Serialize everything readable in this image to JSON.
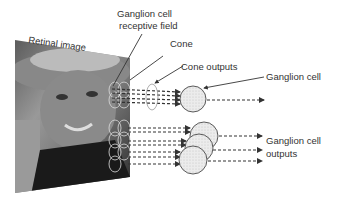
{
  "labels": {
    "retinal_image": "Retinal image",
    "rf_line1": "Ganglion cell",
    "rf_line2": "receptive field",
    "cone": "Cone",
    "cone_outputs": "Cone outputs",
    "ganglion_cell": "Ganglion cell",
    "outputs_line1": "Ganglion cell",
    "outputs_line2": "outputs"
  },
  "colors": {
    "ink": "#333333",
    "cell_fill": "#e6e6e6",
    "background": "#ffffff"
  }
}
